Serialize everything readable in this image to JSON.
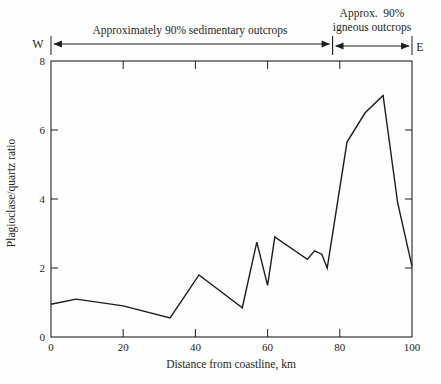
{
  "compass": {
    "west": "W",
    "east": "E"
  },
  "chart_data": {
    "type": "line",
    "title": "",
    "xlabel": "Distance from coastline, km",
    "ylabel": "Plagioclase/quartz ratio",
    "xlim": [
      0,
      100
    ],
    "ylim": [
      0,
      8
    ],
    "xticks": [
      0,
      20,
      40,
      60,
      80,
      100
    ],
    "yticks": [
      0,
      2,
      4,
      6,
      8
    ],
    "grid": false,
    "legend": false,
    "line_color": "#1c1c1c",
    "points": [
      [
        0,
        0.95
      ],
      [
        7,
        1.1
      ],
      [
        20,
        0.9
      ],
      [
        33,
        0.55
      ],
      [
        41,
        1.8
      ],
      [
        53,
        0.85
      ],
      [
        57,
        2.75
      ],
      [
        60,
        1.5
      ],
      [
        62,
        2.9
      ],
      [
        71,
        2.25
      ],
      [
        73,
        2.5
      ],
      [
        75,
        2.4
      ],
      [
        76.5,
        2.0
      ],
      [
        82,
        5.65
      ],
      [
        87,
        6.5
      ],
      [
        92,
        7.0
      ],
      [
        96,
        3.9
      ],
      [
        100,
        2.05
      ]
    ],
    "annotations": [
      {
        "label": "Approximately 90% sedimentary outcrops",
        "x_start": 0,
        "x_end": 78
      },
      {
        "label": "Approx. 90% igneous outcrops",
        "label_line1": "Approx.  90%",
        "label_line2": "igneous outcrops",
        "x_start": 78,
        "x_end": 100
      }
    ]
  }
}
